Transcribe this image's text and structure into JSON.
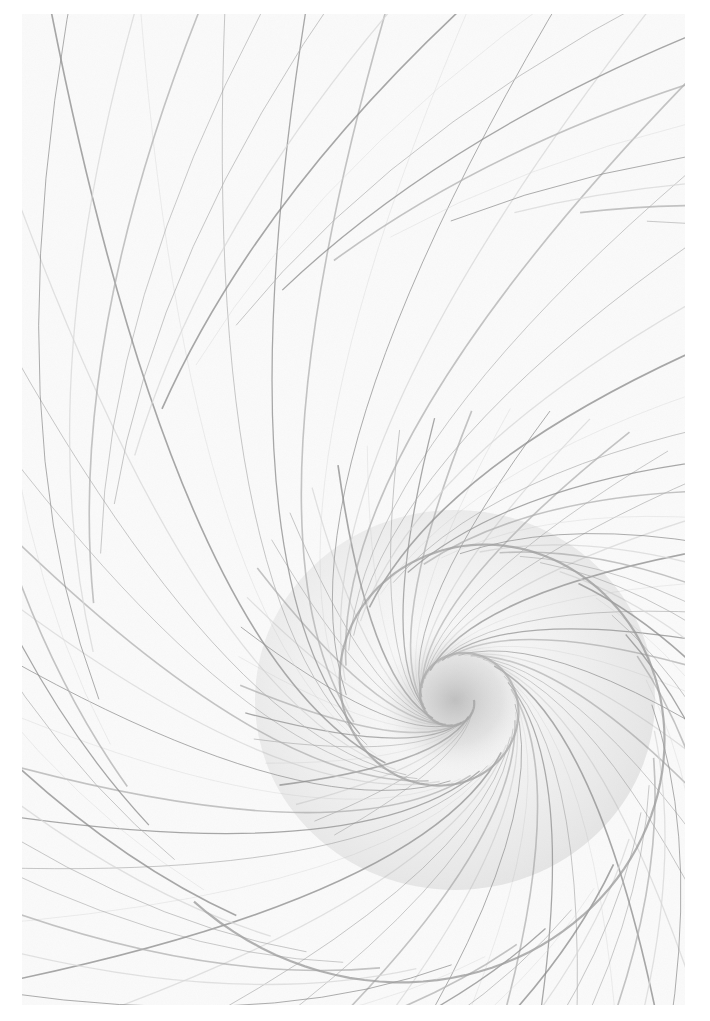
{
  "artwork": {
    "subject": "nautilus spiral shell pencil drawing",
    "style": "graphite sketch",
    "colors": {
      "paper": "#fbfbfb",
      "light_stroke": "#d8d8d8",
      "mid_stroke": "#b0b0b0",
      "dark_stroke": "#8a8a8a",
      "shadow": "#9d9d9d"
    },
    "spiral_center": {
      "x": 455,
      "y": 700
    },
    "frame": {
      "x": 22,
      "y": 14,
      "width": 663,
      "height": 991
    }
  }
}
